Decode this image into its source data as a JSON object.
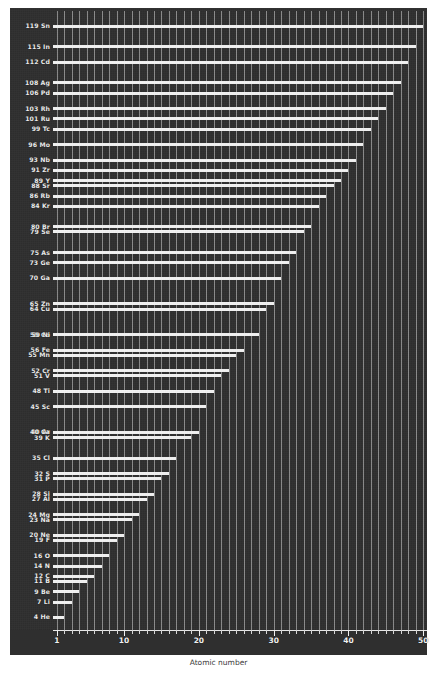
{
  "chart_data": {
    "type": "bar",
    "orientation": "horizontal",
    "title": "",
    "xlabel": "Atomic number",
    "ylabel": "",
    "xlim": [
      0.5,
      50.5
    ],
    "xticks": [
      1,
      10,
      20,
      30,
      40,
      50
    ],
    "xtick_labels": [
      "1",
      "10",
      "20",
      "30",
      "40",
      "50"
    ],
    "minor_xticks_every": 1,
    "grid": "vertical-every-unit",
    "legend": "none",
    "background_color": "#2f2f2f",
    "bar_color": "#f2f2f2",
    "grid_color": "#9a9a9a",
    "text_color": "#ececec",
    "categories": [
      "1 H",
      "4 He",
      "7 Li",
      "9 Be",
      "11 B",
      "12 C",
      "14 N",
      "16 O",
      "19 F",
      "20 Ne",
      "23 Na",
      "24 Mg",
      "27 Al",
      "28 Si",
      "31 P",
      "32 S",
      "35 Cl",
      "40 Ar",
      "39 K",
      "40 Ca",
      "45 Sc",
      "48 Ti",
      "51 V",
      "52 Cr",
      "55 Mn",
      "56 Fe",
      "59 Co",
      "59 Ni",
      "64 Cu",
      "65 Zn",
      "70 Ga",
      "73 Ge",
      "75 As",
      "79 Se",
      "80 Br",
      "84 Kr",
      "86 Rb",
      "88 Sr",
      "89 Y",
      "91 Zr",
      "96 Mo",
      "99 Tc",
      "101 Ru",
      "103 Rh",
      "106 Pd",
      "108 Ag",
      "112 Cd",
      "115 In",
      "119 Sn"
    ],
    "values": [
      1,
      2,
      3,
      4,
      5,
      6,
      7,
      8,
      9,
      10,
      11,
      12,
      13,
      14,
      15,
      16,
      17,
      18,
      19,
      20,
      21,
      22,
      23,
      24,
      25,
      26,
      27,
      28,
      29,
      30,
      31,
      32,
      33,
      34,
      35,
      36,
      37,
      38,
      39,
      40,
      42,
      43,
      44,
      45,
      46,
      47,
      48,
      49,
      50
    ],
    "points": [
      {
        "label": "1 H",
        "symbol": "H",
        "mass": 1,
        "atomic_number": 1
      },
      {
        "label": "4 He",
        "symbol": "He",
        "mass": 4,
        "atomic_number": 2
      },
      {
        "label": "7 Li",
        "symbol": "Li",
        "mass": 7,
        "atomic_number": 3
      },
      {
        "label": "9 Be",
        "symbol": "Be",
        "mass": 9,
        "atomic_number": 4
      },
      {
        "label": "11 B",
        "symbol": "B",
        "mass": 11,
        "atomic_number": 5
      },
      {
        "label": "12 C",
        "symbol": "C",
        "mass": 12,
        "atomic_number": 6
      },
      {
        "label": "14 N",
        "symbol": "N",
        "mass": 14,
        "atomic_number": 7
      },
      {
        "label": "16 O",
        "symbol": "O",
        "mass": 16,
        "atomic_number": 8
      },
      {
        "label": "19 F",
        "symbol": "F",
        "mass": 19,
        "atomic_number": 9
      },
      {
        "label": "20 Ne",
        "symbol": "Ne",
        "mass": 20,
        "atomic_number": 10
      },
      {
        "label": "23 Na",
        "symbol": "Na",
        "mass": 23,
        "atomic_number": 11
      },
      {
        "label": "24 Mg",
        "symbol": "Mg",
        "mass": 24,
        "atomic_number": 12
      },
      {
        "label": "27 Al",
        "symbol": "Al",
        "mass": 27,
        "atomic_number": 13
      },
      {
        "label": "28 Si",
        "symbol": "Si",
        "mass": 28,
        "atomic_number": 14
      },
      {
        "label": "31 P",
        "symbol": "P",
        "mass": 31,
        "atomic_number": 15
      },
      {
        "label": "32 S",
        "symbol": "S",
        "mass": 32,
        "atomic_number": 16
      },
      {
        "label": "35 Cl",
        "symbol": "Cl",
        "mass": 35,
        "atomic_number": 17
      },
      {
        "label": "40 Ar",
        "symbol": "Ar",
        "mass": 40,
        "atomic_number": 18
      },
      {
        "label": "39 K",
        "symbol": "K",
        "mass": 39,
        "atomic_number": 19
      },
      {
        "label": "40 Ca",
        "symbol": "Ca",
        "mass": 40,
        "atomic_number": 20
      },
      {
        "label": "45 Sc",
        "symbol": "Sc",
        "mass": 45,
        "atomic_number": 21
      },
      {
        "label": "48 Ti",
        "symbol": "Ti",
        "mass": 48,
        "atomic_number": 22
      },
      {
        "label": "51 V",
        "symbol": "V",
        "mass": 51,
        "atomic_number": 23
      },
      {
        "label": "52 Cr",
        "symbol": "Cr",
        "mass": 52,
        "atomic_number": 24
      },
      {
        "label": "55 Mn",
        "symbol": "Mn",
        "mass": 55,
        "atomic_number": 25
      },
      {
        "label": "56 Fe",
        "symbol": "Fe",
        "mass": 56,
        "atomic_number": 26
      },
      {
        "label": "59 Co",
        "symbol": "Co",
        "mass": 59,
        "atomic_number": 27
      },
      {
        "label": "59 Ni",
        "symbol": "Ni",
        "mass": 59,
        "atomic_number": 28
      },
      {
        "label": "64 Cu",
        "symbol": "Cu",
        "mass": 64,
        "atomic_number": 29
      },
      {
        "label": "65 Zn",
        "symbol": "Zn",
        "mass": 65,
        "atomic_number": 30
      },
      {
        "label": "70 Ga",
        "symbol": "Ga",
        "mass": 70,
        "atomic_number": 31
      },
      {
        "label": "73 Ge",
        "symbol": "Ge",
        "mass": 73,
        "atomic_number": 32
      },
      {
        "label": "75 As",
        "symbol": "As",
        "mass": 75,
        "atomic_number": 33
      },
      {
        "label": "79 Se",
        "symbol": "Se",
        "mass": 79,
        "atomic_number": 34
      },
      {
        "label": "80 Br",
        "symbol": "Br",
        "mass": 80,
        "atomic_number": 35
      },
      {
        "label": "84 Kr",
        "symbol": "Kr",
        "mass": 84,
        "atomic_number": 36
      },
      {
        "label": "86 Rb",
        "symbol": "Rb",
        "mass": 86,
        "atomic_number": 37
      },
      {
        "label": "88 Sr",
        "symbol": "Sr",
        "mass": 88,
        "atomic_number": 38
      },
      {
        "label": "89 Y",
        "symbol": "Y",
        "mass": 89,
        "atomic_number": 39
      },
      {
        "label": "91 Zr",
        "symbol": "Zr",
        "mass": 91,
        "atomic_number": 40
      },
      {
        "label": "93 Nb",
        "symbol": "Nb",
        "mass": 93,
        "atomic_number": 41
      },
      {
        "label": "96 Mo",
        "symbol": "Mo",
        "mass": 96,
        "atomic_number": 42
      },
      {
        "label": "99 Tc",
        "symbol": "Tc",
        "mass": 99,
        "atomic_number": 43
      },
      {
        "label": "101 Ru",
        "symbol": "Ru",
        "mass": 101,
        "atomic_number": 44
      },
      {
        "label": "103 Rh",
        "symbol": "Rh",
        "mass": 103,
        "atomic_number": 45
      },
      {
        "label": "106 Pd",
        "symbol": "Pd",
        "mass": 106,
        "atomic_number": 46
      },
      {
        "label": "108 Ag",
        "symbol": "Ag",
        "mass": 108,
        "atomic_number": 47
      },
      {
        "label": "112 Cd",
        "symbol": "Cd",
        "mass": 112,
        "atomic_number": 48
      },
      {
        "label": "115 In",
        "symbol": "In",
        "mass": 115,
        "atomic_number": 49
      },
      {
        "label": "119 Sn",
        "symbol": "Sn",
        "mass": 119,
        "atomic_number": 50
      }
    ],
    "ylim_mass": [
      0,
      122
    ]
  }
}
